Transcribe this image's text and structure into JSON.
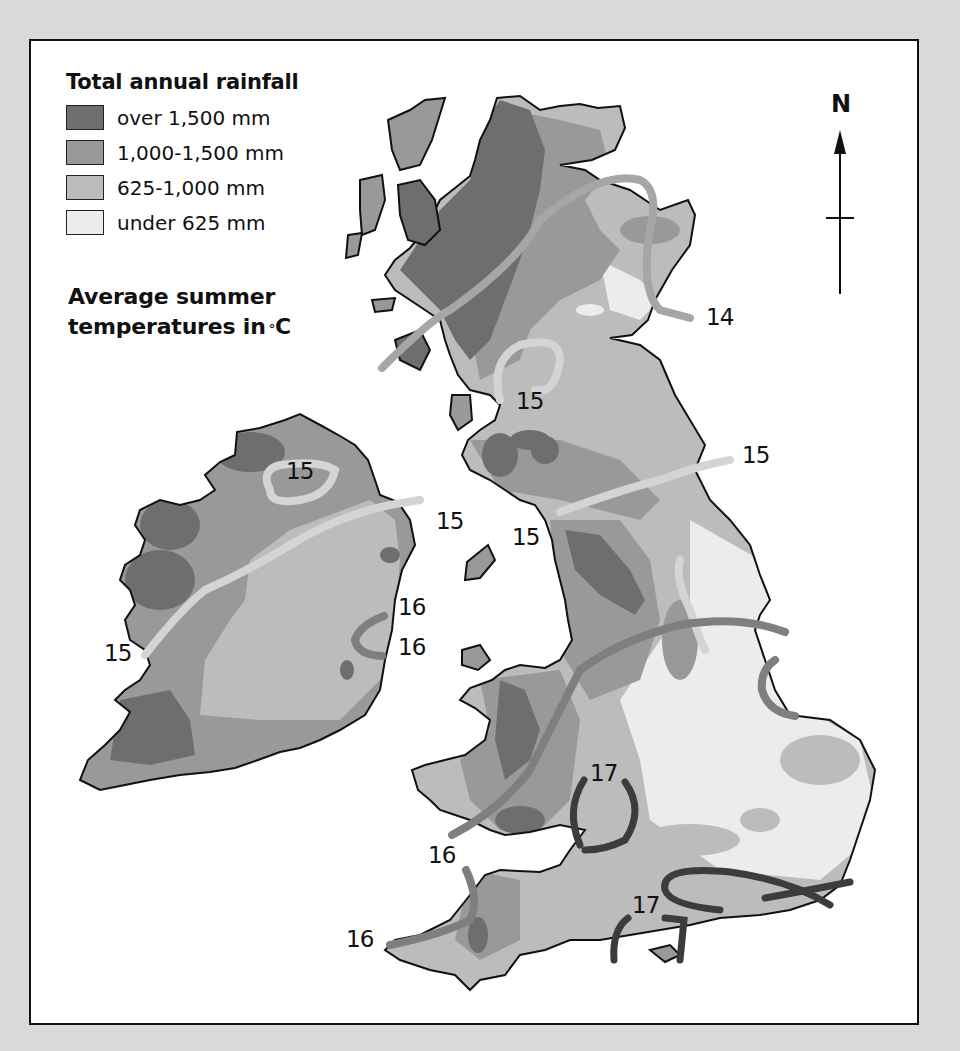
{
  "legend": {
    "rainfall_title": "Total annual rainfall",
    "rainfall_classes": [
      {
        "label": "over 1,500 mm",
        "color": "#6e6e6e"
      },
      {
        "label": "1,000-1,500 mm",
        "color": "#999999"
      },
      {
        "label": "625-1,000 mm",
        "color": "#bcbcbc"
      },
      {
        "label": "under 625 mm",
        "color": "#ececec"
      }
    ],
    "temperature_title_line1": "Average summer",
    "temperature_title_line2": "temperatures in",
    "temperature_unit_degree": "°",
    "temperature_unit": "C"
  },
  "north_arrow": {
    "label": "N"
  },
  "isotherm_colors": {
    "14": "#a6a6a6",
    "15": "#d4d4d4",
    "16": "#7f7f7f",
    "17": "#3c3c3c"
  },
  "isotherm_labels": [
    {
      "text": "14",
      "x": 706,
      "y": 304
    },
    {
      "text": "15",
      "x": 516,
      "y": 388
    },
    {
      "text": "15",
      "x": 742,
      "y": 442
    },
    {
      "text": "15",
      "x": 286,
      "y": 458
    },
    {
      "text": "15",
      "x": 436,
      "y": 508
    },
    {
      "text": "15",
      "x": 512,
      "y": 524
    },
    {
      "text": "16",
      "x": 398,
      "y": 594
    },
    {
      "text": "16",
      "x": 398,
      "y": 634
    },
    {
      "text": "15",
      "x": 104,
      "y": 640
    },
    {
      "text": "17",
      "x": 590,
      "y": 760
    },
    {
      "text": "16",
      "x": 428,
      "y": 842
    },
    {
      "text": "17",
      "x": 632,
      "y": 892
    },
    {
      "text": "16",
      "x": 346,
      "y": 926
    }
  ]
}
